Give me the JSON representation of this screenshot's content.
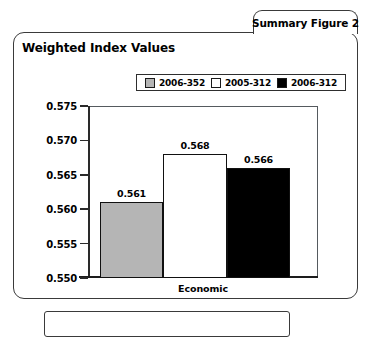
{
  "figure": {
    "tab_label": "Summary Figure 2",
    "title": "Weighted Index Values"
  },
  "chart_data": {
    "type": "bar",
    "title": "Weighted Index Values",
    "xlabel": "Economic",
    "ylabel": "",
    "categories": [
      "Economic"
    ],
    "ylim": [
      0.55,
      0.575
    ],
    "ytick_labels": [
      "0.575",
      "0.570",
      "0.565",
      "0.560",
      "0.555",
      "0.550"
    ],
    "yticks": [
      0.575,
      0.57,
      0.565,
      0.56,
      0.555,
      0.55
    ],
    "grid": false,
    "legend_position": "top",
    "series": [
      {
        "name": "2006-352",
        "values": [
          0.561
        ],
        "value_label": "0.561",
        "color": "#b5b5b5"
      },
      {
        "name": "2005-312",
        "values": [
          0.568
        ],
        "value_label": "0.568",
        "color": "#ffffff"
      },
      {
        "name": "2006-312",
        "values": [
          0.566
        ],
        "value_label": "0.566",
        "color": "#000000"
      }
    ]
  },
  "colors": {
    "series_2006_352": "#b5b5b5",
    "series_2005_312": "#ffffff",
    "series_2006_312": "#000000",
    "border": "#3a3a3a",
    "axis": "#1d1d1d"
  }
}
